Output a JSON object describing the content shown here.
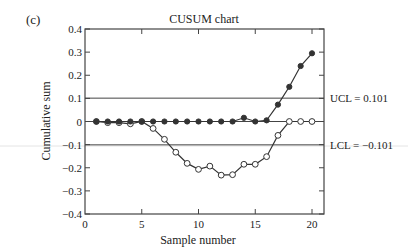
{
  "panel_label": "(c)",
  "chart_data": {
    "type": "line",
    "title": "CUSUM chart",
    "xlabel": "Sample number",
    "ylabel": "Cumulative sum",
    "xlim": [
      0,
      21
    ],
    "ylim": [
      -0.4,
      0.4
    ],
    "xticks": [
      0,
      5,
      10,
      15,
      20
    ],
    "yticks": [
      -0.4,
      -0.3,
      -0.2,
      -0.1,
      0,
      0.1,
      0.2,
      0.3,
      0.4
    ],
    "ytick_labels": [
      "−0.4",
      "−0.3",
      "−0.2",
      "−0.1",
      "0",
      "0.1",
      "0.2",
      "0.3",
      "0.4"
    ],
    "xtick_labels": [
      "0",
      "5",
      "10",
      "15",
      "20"
    ],
    "grid": false,
    "x": [
      1,
      2,
      3,
      4,
      5,
      6,
      7,
      8,
      9,
      10,
      11,
      12,
      13,
      14,
      15,
      16,
      17,
      18,
      19,
      20
    ],
    "series": [
      {
        "name": "Upper CUSUM",
        "marker": "filled-circle",
        "values": [
          0,
          0,
          0,
          0,
          0,
          0,
          0,
          0,
          0,
          0,
          0,
          0,
          0,
          0.016,
          0,
          0.005,
          0.073,
          0.15,
          0.24,
          0.295
        ]
      },
      {
        "name": "Lower CUSUM",
        "marker": "open-circle",
        "values": [
          0,
          -0.005,
          -0.005,
          -0.01,
          0,
          -0.03,
          -0.077,
          -0.133,
          -0.181,
          -0.207,
          -0.193,
          -0.232,
          -0.23,
          -0.185,
          -0.185,
          -0.152,
          -0.06,
          0,
          0,
          0
        ]
      }
    ],
    "reference_lines": [
      {
        "name": "UCL",
        "value": 0.101,
        "label": "UCL = 0.101"
      },
      {
        "name": "center",
        "value": 0,
        "label": ""
      },
      {
        "name": "LCL",
        "value": -0.101,
        "label": "LCL = −0.101"
      }
    ],
    "legend": null
  }
}
